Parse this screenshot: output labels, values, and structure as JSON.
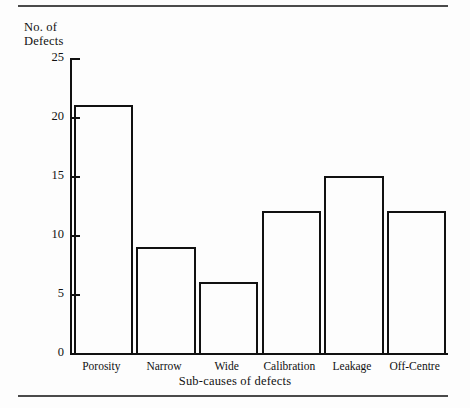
{
  "figure": {
    "background_color": "#fdfdfd",
    "line_color": "#111111",
    "rule_color": "#4a4a4a"
  },
  "chart_data": {
    "type": "bar",
    "title": "",
    "categories": [
      "Porosity",
      "Narrow",
      "Wide",
      "Calibration",
      "Leakage",
      "Off-Centre"
    ],
    "values": [
      21,
      9,
      6,
      12,
      15,
      12
    ],
    "xlabel": "Sub-causes of defects",
    "ylabel": "No. of Defects",
    "ylabel_lines": [
      "No. of",
      "Defects"
    ],
    "ylim": [
      0,
      25
    ],
    "yticks": [
      0,
      5,
      10,
      15,
      20,
      25
    ],
    "ytick_labels": [
      "0",
      "5",
      "10",
      "15",
      "20",
      "25"
    ],
    "grid": false,
    "legend": null,
    "bar_style": "outlined",
    "bar_fill": "none"
  }
}
